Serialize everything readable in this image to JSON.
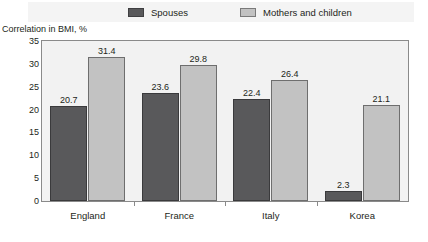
{
  "legend": {
    "items": [
      {
        "label": "Spouses",
        "swatch": "dark-swatch-icon",
        "color": "#59595b"
      },
      {
        "label": "Mothers and children",
        "swatch": "light-swatch-icon",
        "color": "#c2c2c2"
      }
    ]
  },
  "axis": {
    "ylabel": "Correlation in BMI, %",
    "yticks": [
      "0",
      "5",
      "10",
      "15",
      "20",
      "25",
      "30",
      "35"
    ]
  },
  "chart_data": {
    "type": "bar",
    "title": "",
    "subtitle": "",
    "xlabel": "",
    "ylabel": "Correlation in BMI, %",
    "ylim": [
      0,
      35
    ],
    "yticks": [
      0,
      5,
      10,
      15,
      20,
      25,
      30,
      35
    ],
    "grid": false,
    "legend_position": "top",
    "categories": [
      "England",
      "France",
      "Italy",
      "Korea"
    ],
    "series": [
      {
        "name": "Spouses",
        "color": "#59595b",
        "values": [
          20.7,
          23.6,
          22.4,
          2.3
        ]
      },
      {
        "name": "Mothers and children",
        "color": "#c2c2c2",
        "values": [
          31.4,
          29.8,
          26.4,
          21.1
        ]
      }
    ]
  }
}
